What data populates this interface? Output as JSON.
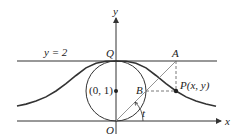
{
  "diagram": {
    "labels": {
      "y_axis": "y",
      "x_axis": "x",
      "line_label": "y = 2",
      "Q": "Q",
      "A": "A",
      "B": "B",
      "P": "P(x, y)",
      "center": "(0, 1)",
      "O": "O",
      "angle": "t"
    },
    "colors": {
      "stroke": "#333333",
      "light_stroke": "#888888",
      "background": "#ffffff"
    },
    "geometry": {
      "origin_px": [
        116,
        121
      ],
      "unit_px": 30,
      "circle_center": [
        0,
        1
      ],
      "circle_radius": 1,
      "horizontal_line_y": 2,
      "P": [
        2,
        1
      ],
      "A": [
        2,
        2
      ],
      "curve": "y = 8/(x^2 + 4)"
    }
  }
}
